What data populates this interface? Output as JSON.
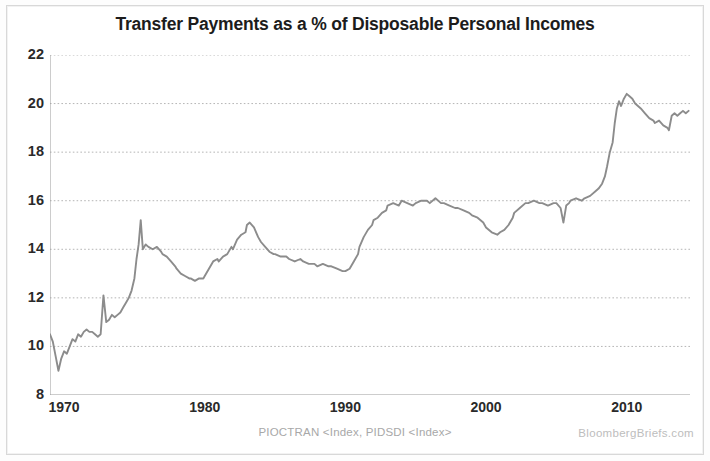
{
  "chart_data": {
    "type": "line",
    "title": "Transfer Payments as a % of Disposable Personal Incomes",
    "xlabel": "",
    "ylabel": "",
    "xlim": [
      1969.0,
      2014.5
    ],
    "ylim": [
      8,
      22
    ],
    "yticks": [
      8,
      10,
      12,
      14,
      16,
      18,
      20,
      22
    ],
    "ytick_labels": [
      "8",
      "10",
      "12",
      "14",
      "16",
      "18",
      "20",
      "22"
    ],
    "xticks": [
      1970,
      1980,
      1990,
      2000,
      2010
    ],
    "xtick_labels": [
      "1970",
      "1980",
      "1990",
      "2000",
      "2010"
    ],
    "grid": true,
    "grid_style": "dotted-horizontal",
    "legend": null,
    "line_color": "#8c8c8c",
    "series": [
      {
        "name": "Transfer Payments as % of Disposable Personal Income",
        "x": [
          1969.0,
          1969.2,
          1969.4,
          1969.6,
          1969.8,
          1970.0,
          1970.2,
          1970.4,
          1970.6,
          1970.8,
          1971.0,
          1971.2,
          1971.4,
          1971.6,
          1971.8,
          1972.0,
          1972.2,
          1972.4,
          1972.6,
          1972.8,
          1973.0,
          1973.2,
          1973.4,
          1973.6,
          1973.8,
          1974.0,
          1974.2,
          1974.4,
          1974.6,
          1974.8,
          1975.0,
          1975.15,
          1975.3,
          1975.45,
          1975.6,
          1975.8,
          1976.0,
          1976.3,
          1976.6,
          1976.9,
          1977.0,
          1977.3,
          1977.6,
          1977.9,
          1978.0,
          1978.3,
          1978.6,
          1978.9,
          1979.0,
          1979.3,
          1979.6,
          1979.9,
          1980.0,
          1980.3,
          1980.6,
          1980.9,
          1981.0,
          1981.3,
          1981.6,
          1981.9,
          1982.0,
          1982.3,
          1982.6,
          1982.9,
          1983.0,
          1983.2,
          1983.5,
          1983.8,
          1984.0,
          1984.3,
          1984.6,
          1984.9,
          1985.0,
          1985.4,
          1985.8,
          1986.0,
          1986.4,
          1986.8,
          1987.0,
          1987.4,
          1987.8,
          1988.0,
          1988.4,
          1988.8,
          1989.0,
          1989.4,
          1989.8,
          1990.0,
          1990.3,
          1990.6,
          1990.9,
          1991.0,
          1991.3,
          1991.6,
          1991.9,
          1992.0,
          1992.3,
          1992.6,
          1992.9,
          1993.0,
          1993.4,
          1993.8,
          1994.0,
          1994.4,
          1994.8,
          1995.0,
          1995.4,
          1995.8,
          1996.0,
          1996.4,
          1996.8,
          1997.0,
          1997.4,
          1997.8,
          1998.0,
          1998.4,
          1998.8,
          1999.0,
          1999.4,
          1999.8,
          2000.0,
          2000.4,
          2000.8,
          2001.0,
          2001.3,
          2001.6,
          2001.9,
          2002.0,
          2002.4,
          2002.8,
          2003.0,
          2003.4,
          2003.8,
          2004.0,
          2004.4,
          2004.8,
          2005.0,
          2005.3,
          2005.5,
          2005.7,
          2005.9,
          2006.0,
          2006.4,
          2006.8,
          2007.0,
          2007.4,
          2007.8,
          2008.0,
          2008.25,
          2008.45,
          2008.6,
          2008.8,
          2009.0,
          2009.15,
          2009.3,
          2009.45,
          2009.6,
          2009.8,
          2010.0,
          2010.2,
          2010.4,
          2010.6,
          2010.8,
          2011.0,
          2011.3,
          2011.6,
          2011.9,
          2012.0,
          2012.3,
          2012.6,
          2012.9,
          2013.0,
          2013.2,
          2013.4,
          2013.6,
          2013.8,
          2014.0,
          2014.2,
          2014.4
        ],
        "y": [
          10.5,
          10.2,
          9.6,
          9.0,
          9.5,
          9.8,
          9.7,
          10.0,
          10.3,
          10.2,
          10.5,
          10.4,
          10.6,
          10.7,
          10.6,
          10.6,
          10.5,
          10.4,
          10.5,
          12.1,
          11.0,
          11.1,
          11.3,
          11.2,
          11.3,
          11.4,
          11.6,
          11.8,
          12.0,
          12.3,
          12.8,
          13.6,
          14.2,
          15.2,
          14.0,
          14.2,
          14.1,
          14.0,
          14.1,
          13.9,
          13.8,
          13.7,
          13.5,
          13.3,
          13.2,
          13.0,
          12.9,
          12.8,
          12.8,
          12.7,
          12.8,
          12.8,
          12.9,
          13.2,
          13.5,
          13.6,
          13.5,
          13.7,
          13.8,
          14.1,
          14.0,
          14.4,
          14.6,
          14.7,
          15.0,
          15.1,
          14.9,
          14.5,
          14.3,
          14.1,
          13.9,
          13.8,
          13.8,
          13.7,
          13.7,
          13.6,
          13.5,
          13.6,
          13.5,
          13.4,
          13.4,
          13.3,
          13.4,
          13.3,
          13.3,
          13.2,
          13.1,
          13.1,
          13.2,
          13.5,
          13.8,
          14.1,
          14.5,
          14.8,
          15.0,
          15.2,
          15.3,
          15.5,
          15.6,
          15.8,
          15.9,
          15.8,
          16.0,
          15.9,
          15.8,
          15.9,
          16.0,
          16.0,
          15.9,
          16.1,
          15.9,
          15.9,
          15.8,
          15.7,
          15.7,
          15.6,
          15.5,
          15.4,
          15.3,
          15.1,
          14.9,
          14.7,
          14.6,
          14.7,
          14.8,
          15.0,
          15.3,
          15.5,
          15.7,
          15.9,
          15.9,
          16.0,
          15.9,
          15.9,
          15.8,
          15.9,
          15.9,
          15.7,
          15.1,
          15.8,
          15.9,
          16.0,
          16.1,
          16.0,
          16.1,
          16.2,
          16.4,
          16.5,
          16.7,
          17.0,
          17.4,
          18.0,
          18.4,
          19.2,
          19.8,
          20.1,
          19.9,
          20.2,
          20.4,
          20.3,
          20.2,
          20.0,
          19.9,
          19.8,
          19.6,
          19.4,
          19.3,
          19.2,
          19.3,
          19.1,
          19.0,
          18.9,
          19.5,
          19.6,
          19.5,
          19.6,
          19.7,
          19.6,
          19.7
        ]
      }
    ]
  },
  "footer": {
    "source": "PIOCTRAN <Index, PIDSDI <Index>",
    "watermark": "BloombergBriefs.com"
  }
}
